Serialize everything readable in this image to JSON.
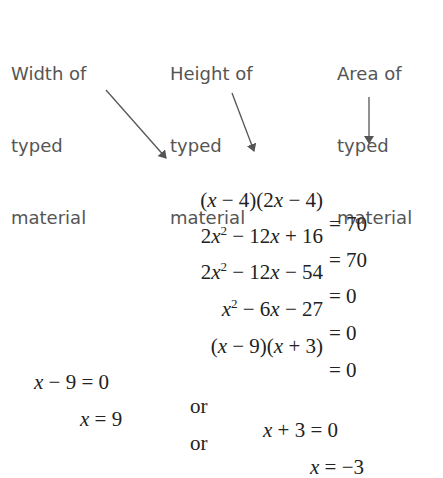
{
  "labels": {
    "width": {
      "line1": "Width of",
      "line2": "typed",
      "line3": "material"
    },
    "height": {
      "line1": "Height of",
      "line2": "typed",
      "line3": "material"
    },
    "area": {
      "line1": "Area of",
      "line2": "typed",
      "line3": "material"
    }
  },
  "equations": [
    {
      "lhs": "(x − 4)(2x − 4)",
      "rhs": "= 70"
    },
    {
      "lhs": "2x² − 12x + 16",
      "rhs": "= 70"
    },
    {
      "lhs": "2x² − 12x − 54",
      "rhs": "= 0"
    },
    {
      "lhs": "x² − 6x − 27",
      "rhs": "= 0"
    },
    {
      "lhs": "(x − 9)(x + 3)",
      "rhs": "= 0"
    }
  ],
  "solutions": [
    {
      "left": "x − 9 = 0",
      "connector": "or",
      "right": "x + 3 = 0"
    },
    {
      "left": "x = 9",
      "connector": "or",
      "right": "x = −3"
    }
  ],
  "colors": {
    "label": "#555555",
    "arrow": "#555555",
    "math": "#222222"
  }
}
